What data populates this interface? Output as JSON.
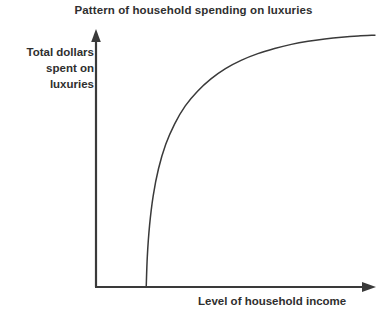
{
  "figure": {
    "title": "Pattern of household spending on luxuries",
    "y_axis_label": "Total dollars\nspent on\nluxuries",
    "x_axis_label": "Level of household income",
    "background_color": "#ffffff",
    "ink_color": "#3a3a3a",
    "text_color": "#2f2f2f"
  },
  "chart_data": {
    "type": "line",
    "title": "Pattern of household spending on luxuries",
    "xlabel": "Level of household income",
    "ylabel": "Total dollars spent on luxuries",
    "xlim": [
      0,
      100
    ],
    "ylim": [
      0,
      100
    ],
    "grid": false,
    "legend": null,
    "axis_style": {
      "x_axis_arrow": true,
      "y_axis_arrow": true,
      "tick_labels": false,
      "tick_marks": false,
      "numeric_scale": false,
      "qualitative": true
    },
    "annotations": [
      "Curve begins at a positive threshold income with zero spending",
      "Spending rises steeply then flattens toward a saturation level"
    ],
    "series": [
      {
        "name": "Luxury spending curve",
        "color": "#3a3a3a",
        "width": 1.5,
        "x": [
          18,
          18.4,
          19.2,
          20.5,
          22.4,
          25,
          28.2,
          32,
          36.4,
          41.2,
          46.4,
          52,
          58,
          64,
          70,
          76,
          82,
          88,
          94,
          100
        ],
        "y": [
          0,
          12,
          24,
          35.5,
          46,
          55.5,
          63.5,
          70.5,
          76.2,
          81,
          85,
          88.2,
          90.8,
          92.8,
          94.4,
          95.6,
          96.5,
          97.2,
          97.7,
          98
        ]
      }
    ]
  },
  "geometry": {
    "origin": {
      "x": 96,
      "y": 287
    },
    "y_axis_top": {
      "x": 96,
      "y": 30
    },
    "x_axis_right": {
      "x": 375,
      "y": 287
    },
    "curve_start": {
      "x": 146,
      "y": 287
    },
    "curve_end": {
      "x": 356,
      "y": 55
    }
  }
}
